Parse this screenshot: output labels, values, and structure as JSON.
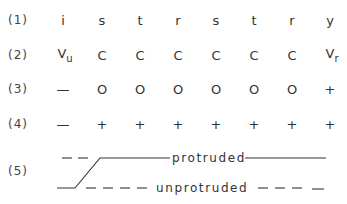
{
  "rows": [
    {
      "label": "(1)",
      "cells": [
        "i",
        "s",
        "t",
        "r",
        "s",
        "t",
        "r",
        "y"
      ]
    },
    {
      "label": "(2)",
      "cells": [
        "V",
        "C",
        "C",
        "C",
        "C",
        "C",
        "C",
        "V"
      ],
      "subscripts": {
        "0": "u",
        "7": "r"
      }
    },
    {
      "label": "(3)",
      "cells": [
        "—",
        "O",
        "O",
        "O",
        "O",
        "O",
        "O",
        "+"
      ]
    },
    {
      "label": "(4)",
      "cells": [
        "—",
        "+",
        "+",
        "+",
        "+",
        "+",
        "+",
        "+"
      ]
    }
  ],
  "row5": {
    "label": "(5)",
    "protruded_label": "protruded",
    "unprotruded_label": "unprotruded"
  }
}
